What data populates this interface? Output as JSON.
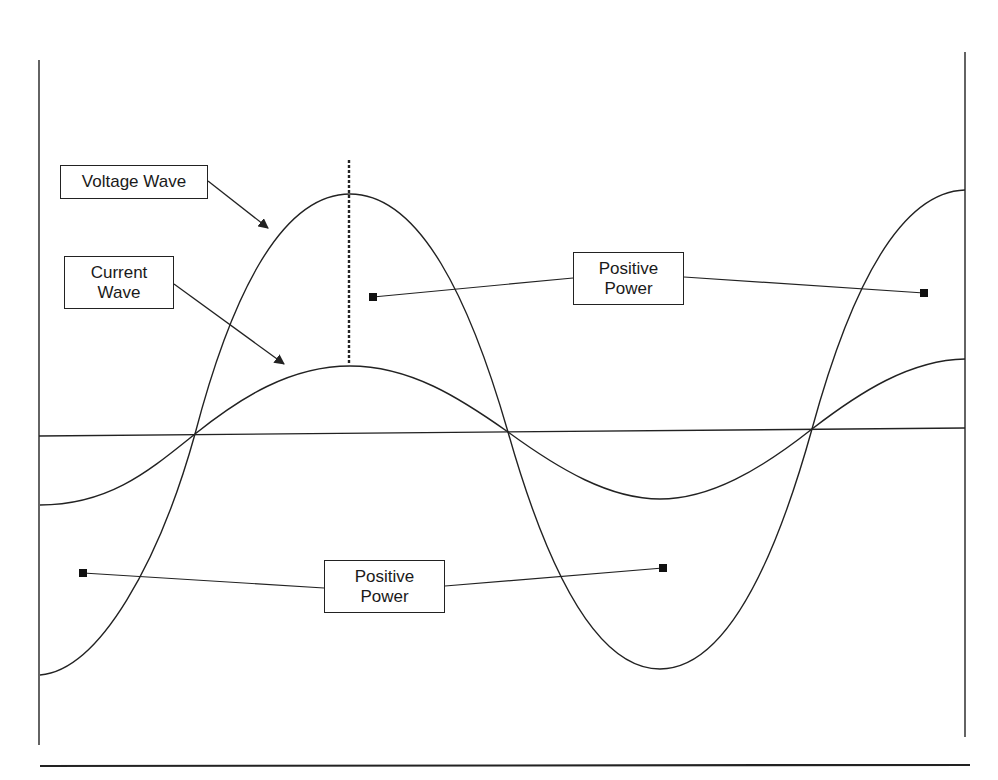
{
  "diagram": {
    "title": "",
    "colors": {
      "line": "#222222",
      "background": "#ffffff",
      "text": "#1a1a1a"
    },
    "labels": {
      "voltage_wave": "Voltage Wave",
      "current_wave": "Current\nWave",
      "positive_power_top": "Positive\nPower",
      "positive_power_bottom": "Positive\nPower"
    },
    "waves": [
      {
        "name": "Voltage Wave",
        "peak_x": 350,
        "peak_y": 194,
        "trough_x": 660,
        "trough_y": 669,
        "zero_crossings_x": [
          195,
          508,
          812
        ]
      },
      {
        "name": "Current Wave",
        "peak_x": 350,
        "peak_y": 366,
        "trough_x": 660,
        "trough_y": 499,
        "zero_crossings_x": [
          195,
          508,
          812
        ]
      }
    ],
    "annotations": [
      {
        "type": "dashed-vertical-line",
        "x": 349,
        "y_from": 160,
        "y_to": 365,
        "note": "peak marker"
      },
      {
        "type": "connector",
        "label": "Positive Power",
        "endpoints": [
          [
            373,
            297
          ],
          [
            924,
            293
          ]
        ]
      },
      {
        "type": "connector",
        "label": "Positive Power",
        "endpoints": [
          [
            83,
            573
          ],
          [
            663,
            568
          ]
        ]
      }
    ]
  }
}
